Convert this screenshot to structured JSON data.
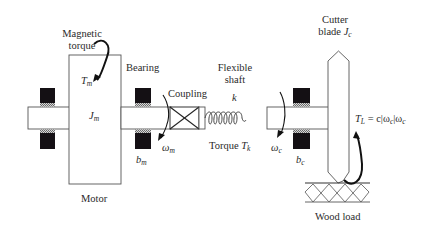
{
  "diagram": {
    "colors": {
      "line": "#3a3a3a",
      "bearing_fill": "#141014",
      "bearing_pad": "#9a9a9a",
      "background": "#ffffff"
    },
    "labels": {
      "magnetic_torque_line1": "Magnetic",
      "magnetic_torque_line2": "torque",
      "tm_symbol": "T",
      "tm_sub": "m",
      "jm_symbol": "J",
      "jm_sub": "m",
      "bearing": "Bearing",
      "coupling": "Coupling",
      "flexible_shaft_line1": "Flexible",
      "flexible_shaft_line2": "shaft",
      "spring_constant": "k",
      "omega_m_symbol": "ω",
      "omega_m_sub": "m",
      "bm_symbol": "b",
      "bm_sub": "m",
      "torque_tk_text": "Torque ",
      "torque_tk_symbol": "T",
      "torque_tk_sub": "k",
      "omega_c_symbol": "ω",
      "omega_c_sub": "c",
      "bc_symbol": "b",
      "bc_sub": "c",
      "cutter_line1": "Cutter",
      "cutter_line2_text": "blade ",
      "cutter_line2_symbol": "J",
      "cutter_line2_sub": "c",
      "load_torque_equation": "T_L = c|ω_c|ω_c",
      "load_tl_symbol": "T",
      "load_tl_sub": "L",
      "load_eq_rest1": " = c|ω",
      "load_eq_sub1": "c",
      "load_eq_rest2": "|ω",
      "load_eq_sub2": "c",
      "motor": "Motor",
      "wood_load": "Wood load"
    },
    "components": [
      {
        "name": "motor",
        "inertia": "J_m",
        "input_torque": "T_m"
      },
      {
        "name": "bearing",
        "damping": "b_m",
        "speed": "ω_m"
      },
      {
        "name": "coupling"
      },
      {
        "name": "flexible-shaft",
        "stiffness": "k",
        "torque": "T_k"
      },
      {
        "name": "bearing",
        "damping": "b_c",
        "speed": "ω_c"
      },
      {
        "name": "cutter-blade",
        "inertia": "J_c",
        "load_torque": "T_L = c|ω_c|ω_c"
      },
      {
        "name": "wood-load"
      }
    ]
  }
}
